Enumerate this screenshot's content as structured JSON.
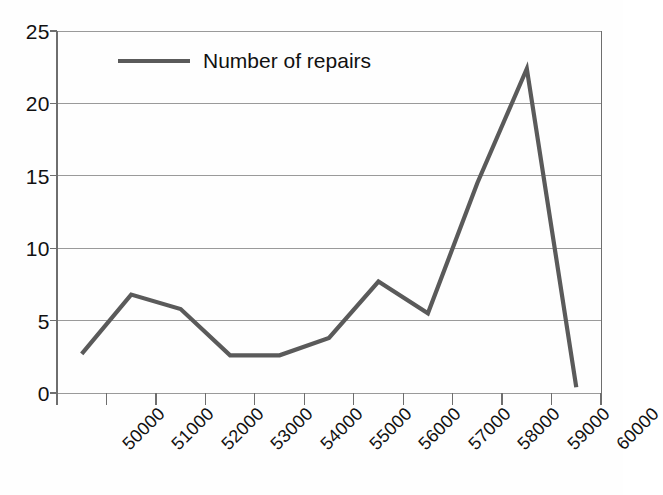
{
  "chart_data": {
    "type": "line",
    "title": "",
    "xlabel": "",
    "ylabel": "",
    "categories": [
      "50000",
      "51000",
      "52000",
      "53000",
      "54000",
      "55000",
      "56000",
      "57000",
      "58000",
      "59000",
      "60000"
    ],
    "series": [
      {
        "name": "Number of repairs",
        "values": [
          2.7,
          6.8,
          5.8,
          2.6,
          2.6,
          3.8,
          7.7,
          5.5,
          14.5,
          22.4,
          0.4
        ]
      }
    ],
    "ylim": [
      0,
      25
    ],
    "yticks": [
      0,
      5,
      10,
      15,
      20,
      25
    ],
    "ytick_labels": [
      "0",
      "5",
      "10",
      "15",
      "20",
      "25"
    ],
    "grid": true,
    "grid_axis": "y",
    "legend": [
      "Number of repairs"
    ],
    "legend_position": "top-left-inside",
    "xtick_rotation": -45,
    "line_color": "#5a5a5a",
    "grid_color": "#9a9a9a",
    "axis_color": "#6e6e6e"
  },
  "legend": {
    "entry_label": "Number of repairs",
    "swatch_name": "line-swatch"
  }
}
